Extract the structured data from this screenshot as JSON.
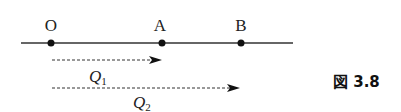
{
  "diagram": {
    "points": [
      {
        "label": "O",
        "x": 51
      },
      {
        "label": "A",
        "x": 162
      },
      {
        "label": "B",
        "x": 241
      }
    ],
    "arrows": [
      {
        "label": "Q",
        "sub": "1",
        "from": "O",
        "to": "A"
      },
      {
        "label": "Q",
        "sub": "2",
        "from": "O",
        "to": "B"
      }
    ],
    "caption": "図 3.8"
  }
}
